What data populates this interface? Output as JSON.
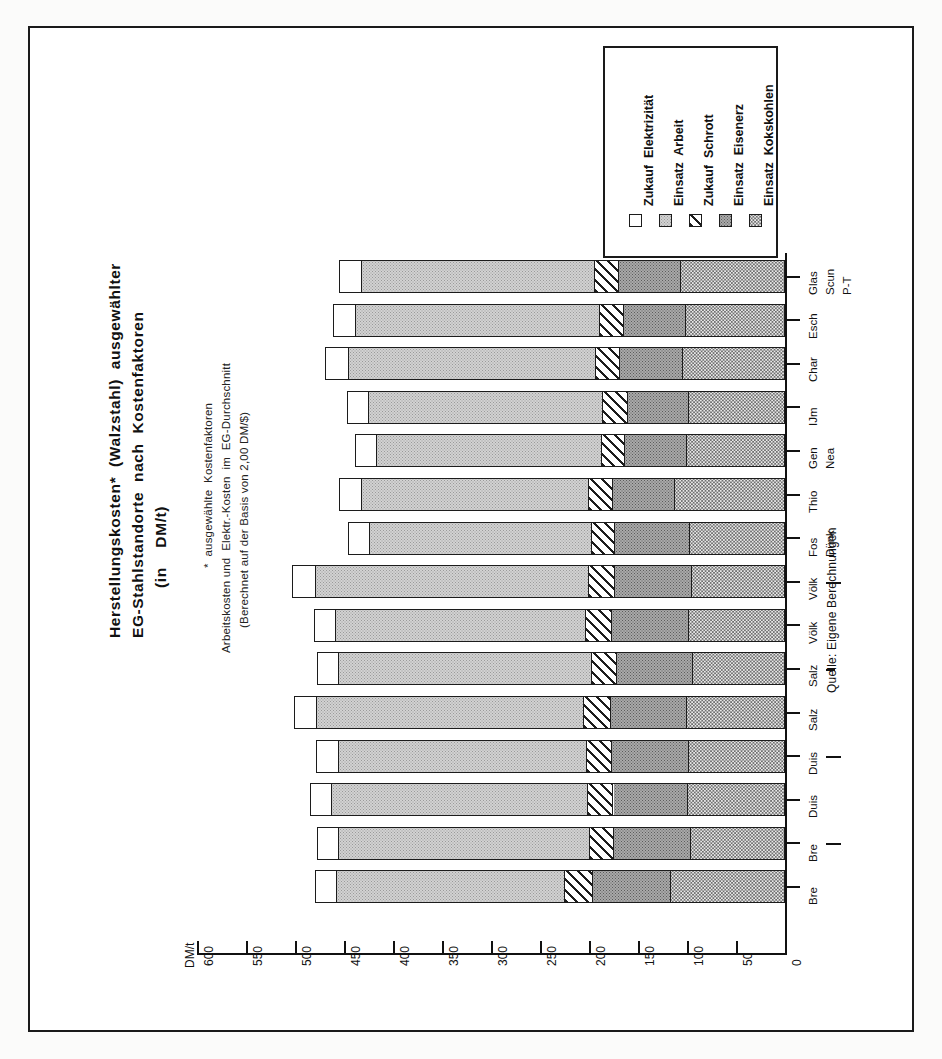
{
  "title": {
    "line1": "Herstellungskosten*  (Walzstahl)  ausgewählter",
    "line2": "EG-Stahlstandorte  nach  Kostenfaktoren",
    "line3": "(in    DM/t)"
  },
  "footnotes": {
    "line1": "*  ausgewählte  Kostenfaktoren",
    "line2": "Arbeitskosten und  Elektr.-Kosten  im  EG-Durchschnitt",
    "line3": "(Berechnet auf der Basis von 2,00 DM/$)"
  },
  "source": "Quelle: Eigene Berechnungen",
  "axis": {
    "unit_label": "DM/t",
    "ticks": [
      "600",
      "550",
      "500",
      "450",
      "400",
      "350",
      "300",
      "250",
      "200",
      "150",
      "100",
      "50",
      "0"
    ]
  },
  "legend": {
    "items": [
      {
        "label": "Zukauf  Elektrizität",
        "fill": "f-elek",
        "name": "legend-item-zukauf-elektrizitaet"
      },
      {
        "label": "Einsatz  Arbeit",
        "fill": "f-arbeit",
        "name": "legend-item-einsatz-arbeit"
      },
      {
        "label": "Zukauf  Schrott",
        "fill": "f-schrott",
        "name": "legend-item-zukauf-schrott"
      },
      {
        "label": "Einsatz  Eisenerz",
        "fill": "f-erz",
        "name": "legend-item-einsatz-eisenerz"
      },
      {
        "label": "Einsatz  Kokskohlen",
        "fill": "f-koks",
        "name": "legend-item-einsatz-kokskohlen"
      }
    ]
  },
  "chart_data": {
    "type": "bar",
    "orientation": "horizontal-rotated",
    "title": "Herstellungskosten* (Walzstahl) ausgewählter EG-Stahlstandorte nach Kostenfaktoren (in DM/t)",
    "xlabel": "",
    "ylabel": "DM/t",
    "ylim": [
      0,
      600
    ],
    "ytick_step": 50,
    "grid": false,
    "legend_position": "top-right",
    "categories": [
      "Bre",
      "Bre —",
      "Duis",
      "Duis —",
      "Salz",
      "Salz –",
      "Völk",
      "Völk —",
      "Fos Dünk",
      "Thio",
      "Gen Nea",
      "IJm",
      "Char",
      "Esch",
      "Glas Scun P-T"
    ],
    "series": [
      {
        "name": "Einsatz Kokskohlen",
        "fill": "f-koks",
        "values": [
          117,
          97,
          100,
          99,
          101,
          95,
          99,
          96,
          98,
          113,
          101,
          99,
          105,
          102,
          107
        ]
      },
      {
        "name": "Einsatz Eisenerz",
        "fill": "f-erz",
        "values": [
          80,
          78,
          76,
          79,
          78,
          77,
          79,
          78,
          76,
          64,
          63,
          62,
          64,
          63,
          63
        ]
      },
      {
        "name": "Zukauf Schrott",
        "fill": "f-schrott",
        "values": [
          28,
          25,
          26,
          25,
          27,
          26,
          26,
          27,
          24,
          24,
          24,
          26,
          25,
          25,
          25
        ]
      },
      {
        "name": "Einsatz Arbeit",
        "fill": "f-arbeit",
        "values": [
          233,
          256,
          261,
          253,
          273,
          258,
          255,
          279,
          226,
          232,
          229,
          238,
          252,
          249,
          238
        ]
      },
      {
        "name": "Zukauf Elektrizität",
        "fill": "f-elek",
        "values": [
          22,
          22,
          22,
          23,
          22,
          22,
          22,
          23,
          22,
          22,
          22,
          22,
          23,
          22,
          22
        ]
      }
    ],
    "totals": [
      480,
      478,
      485,
      479,
      501,
      478,
      481,
      503,
      446,
      455,
      439,
      447,
      469,
      461,
      455
    ]
  }
}
